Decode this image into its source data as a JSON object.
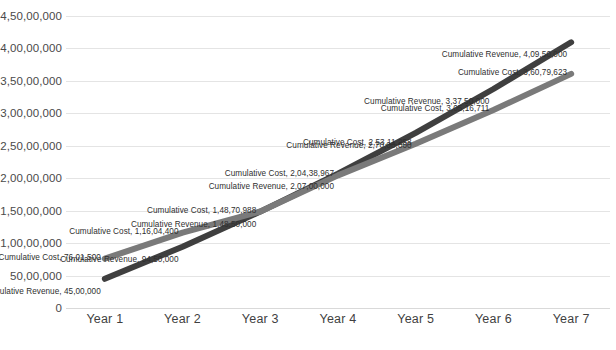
{
  "chart_data": {
    "type": "line",
    "title": "CUMULATIVE REVENUE VS CUMULATIVE COST",
    "xlabel": "",
    "ylabel": "",
    "categories": [
      "Year 1",
      "Year 2",
      "Year 3",
      "Year 4",
      "Year 5",
      "Year 6",
      "Year 7"
    ],
    "ylim": [
      0,
      45000000
    ],
    "ytick_labels": [
      "0",
      "50,00,000",
      "1,00,00,000",
      "1,50,00,000",
      "2,00,00,000",
      "2,50,00,000",
      "3,00,00,000",
      "3,50,00,000",
      "4,00,00,000",
      "4,50,00,000"
    ],
    "ytick_values": [
      0,
      5000000,
      10000000,
      15000000,
      20000000,
      25000000,
      30000000,
      35000000,
      40000000,
      45000000
    ],
    "grid": true,
    "legend": "none",
    "series": [
      {
        "name": "Cumulative Revenue",
        "color": "#3f3f3f",
        "values": [
          4500000,
          9450000,
          14850000,
          20700000,
          27000000,
          33750000,
          40950000
        ],
        "value_labels": [
          "Cumulative Revenue, 45,00,000",
          "Cumulative Revenue, 94,50,000",
          "Cumulative Revenue, 1,48,50,000",
          "Cumulative Revenue, 2,07,00,000",
          "Cumulative Revenue, 2,70,00,000",
          "Cumulative Revenue, 3,37,50,000",
          "Cumulative Revenue, 4,09,50,000"
        ]
      },
      {
        "name": "Cumulative Cost",
        "color": "#7a7a7a",
        "values": [
          7601500,
          11604400,
          14870988,
          20438967,
          25311258,
          30516711,
          36079623
        ],
        "value_labels": [
          "Cumulative Cost, 76,01,500",
          "Cumulative Cost, 1,16,04,400",
          "Cumulative Cost, 1,48,70,988",
          "Cumulative Cost, 2,04,38,967",
          "Cumulative Cost, 2,53,11,258",
          "Cumulative Cost, 3,05,16,711",
          "Cumulative Cost, 3,60,79,623"
        ]
      }
    ]
  }
}
